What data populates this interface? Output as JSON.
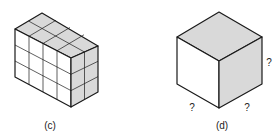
{
  "figures": [
    {
      "id": "c",
      "label": "(c)",
      "description": "rectangular prism built from unit cubes, 4 wide x 2 deep x 3 tall"
    },
    {
      "id": "d",
      "label": "(d)",
      "description": "single cube with unknown edge lengths"
    }
  ],
  "cube_d": {
    "edge_labels": [
      "?",
      "?",
      "?"
    ]
  },
  "colors": {
    "line": "#1a1a1a",
    "shade": "#d9d9d9",
    "face": "#ffffff"
  }
}
